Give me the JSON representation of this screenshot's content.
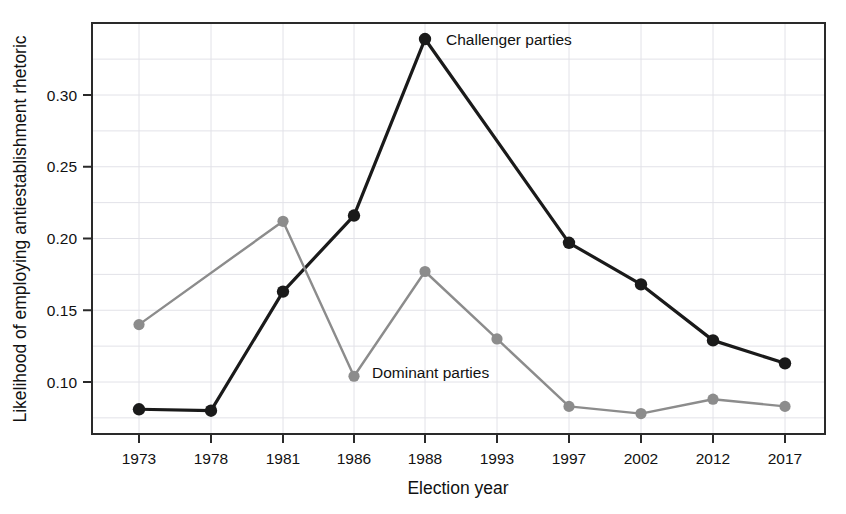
{
  "chart_data": {
    "type": "line",
    "title": "",
    "xlabel": "Election year",
    "ylabel": "Likelihood of employing antiestablishment rhetoric",
    "categories": [
      "1973",
      "1978",
      "1981",
      "1986",
      "1988",
      "1993",
      "1997",
      "2002",
      "2012",
      "2017"
    ],
    "x_tick_labels": [
      "1973",
      "1978",
      "1981",
      "1986",
      "1988",
      "1993",
      "1997",
      "2002",
      "2012",
      "2017"
    ],
    "y_tick_labels": [
      "0.10",
      "0.15",
      "0.20",
      "0.25",
      "0.30"
    ],
    "y_tick_values": [
      0.1,
      0.15,
      0.2,
      0.25,
      0.3
    ],
    "ylim": [
      0.066,
      0.347
    ],
    "grid": true,
    "legend": "inline-annotations",
    "series": [
      {
        "name": "Challenger parties",
        "color": "#1a1a1a",
        "marker": "circle",
        "label_x": "1988",
        "label_text": "Challenger parties",
        "values": [
          0.081,
          0.08,
          0.163,
          0.216,
          0.339,
          null,
          0.197,
          0.168,
          0.129,
          0.113
        ],
        "points": [
          {
            "x": "1973",
            "y": 0.081
          },
          {
            "x": "1978",
            "y": 0.08
          },
          {
            "x": "1981",
            "y": 0.163
          },
          {
            "x": "1986",
            "y": 0.216
          },
          {
            "x": "1988",
            "y": 0.339
          },
          {
            "x": "1997",
            "y": 0.197
          },
          {
            "x": "2002",
            "y": 0.168
          },
          {
            "x": "2012",
            "y": 0.129
          },
          {
            "x": "2017",
            "y": 0.113
          }
        ]
      },
      {
        "name": "Dominant parties",
        "color": "#8c8c8c",
        "marker": "circle",
        "label_x": "1986",
        "label_text": "Dominant parties",
        "values": [
          0.14,
          null,
          0.212,
          0.104,
          0.177,
          0.13,
          0.083,
          0.078,
          0.088,
          0.083
        ],
        "points": [
          {
            "x": "1973",
            "y": 0.14
          },
          {
            "x": "1981",
            "y": 0.212
          },
          {
            "x": "1986",
            "y": 0.104
          },
          {
            "x": "1988",
            "y": 0.177
          },
          {
            "x": "1993",
            "y": 0.13
          },
          {
            "x": "1997",
            "y": 0.083
          },
          {
            "x": "2002",
            "y": 0.078
          },
          {
            "x": "2012",
            "y": 0.088
          },
          {
            "x": "2017",
            "y": 0.083
          }
        ]
      }
    ],
    "annotations": [
      {
        "text": "Challenger parties",
        "x_px": 446,
        "y_px": 45
      },
      {
        "text": "Dominant parties",
        "x_px": 372,
        "y_px": 378
      }
    ],
    "colors": {
      "challenger": "#1a1a1a",
      "dominant": "#8c8c8c",
      "grid": "#e2e2e8",
      "frame": "#2a2a2a",
      "background": "#ffffff"
    }
  },
  "geometry": {
    "plot_left": 92,
    "plot_right": 825,
    "plot_top": 23,
    "plot_bottom": 434,
    "x_positions": [
      139,
      211,
      283,
      354,
      425,
      497,
      569,
      641,
      713,
      785
    ],
    "y_map": {
      "v0": 0.3,
      "px0": 95,
      "v1": 0.1,
      "px1": 382
    }
  }
}
